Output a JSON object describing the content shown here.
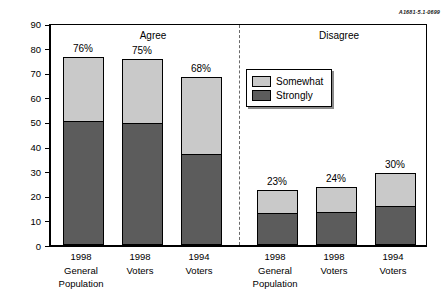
{
  "figure_id": "A1681-5.1-0699",
  "chart_data": {
    "type": "bar",
    "subtype": "stacked-bar",
    "title": "",
    "xlabel": "",
    "ylabel": "Percentage",
    "ylim": [
      0,
      90
    ],
    "yticks": [
      0,
      10,
      20,
      30,
      40,
      50,
      60,
      70,
      80,
      90
    ],
    "grid": false,
    "legend_position": "inside-right",
    "legend": [
      "Somewhat",
      "Strongly"
    ],
    "colors": {
      "somewhat": "#c9c9c9",
      "strongly": "#5c5c5c",
      "axis": "#000000",
      "divider": "#6a6a6a"
    },
    "group_headers": [
      "Agree",
      "Disagree"
    ],
    "categories": [
      "1998\nGeneral\nPopulation",
      "1998\nVoters",
      "1994\nVoters",
      "1998\nGeneral\nPopulation",
      "1998\nVoters",
      "1994\nVoters"
    ],
    "series": [
      {
        "name": "Strongly",
        "values": [
          50,
          49,
          36.5,
          12.5,
          13,
          15.5
        ]
      },
      {
        "name": "Somewhat",
        "values": [
          26,
          26,
          31.5,
          9.5,
          10,
          13.5
        ]
      }
    ],
    "totals": [
      76,
      75,
      68,
      23,
      24,
      30
    ],
    "data_labels": [
      "76%",
      "75%",
      "68%",
      "23%",
      "24%",
      "30%"
    ]
  },
  "axis": {
    "y_title": "Percentage",
    "y_ticks": [
      "90",
      "80",
      "70",
      "60",
      "50",
      "40",
      "30",
      "20",
      "10",
      "0"
    ]
  },
  "groups": [
    {
      "header": "Agree"
    },
    {
      "header": "Disagree"
    }
  ],
  "bars": [
    {
      "label": "76%",
      "line1": "1998",
      "line2": "General",
      "line3": "Population"
    },
    {
      "label": "75%",
      "line1": "1998",
      "line2": "Voters",
      "line3": ""
    },
    {
      "label": "68%",
      "line1": "1994",
      "line2": "Voters",
      "line3": ""
    },
    {
      "label": "23%",
      "line1": "1998",
      "line2": "General",
      "line3": "Population"
    },
    {
      "label": "24%",
      "line1": "1998",
      "line2": "Voters",
      "line3": ""
    },
    {
      "label": "30%",
      "line1": "1994",
      "line2": "Voters",
      "line3": ""
    }
  ],
  "legend": {
    "items": [
      {
        "label": "Somewhat",
        "key": "somewhat"
      },
      {
        "label": "Strongly",
        "key": "strongly"
      }
    ]
  }
}
